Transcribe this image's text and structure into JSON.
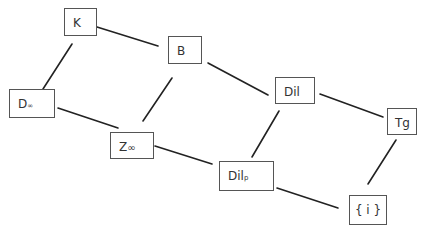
{
  "diagram": {
    "type": "lattice",
    "nodes": [
      {
        "id": "K",
        "label": "K",
        "sub": ""
      },
      {
        "id": "B",
        "label": "B",
        "sub": ""
      },
      {
        "id": "Dinf",
        "label": "D",
        "sub": "∞"
      },
      {
        "id": "Zinf",
        "label": "Z",
        "sub": "∞"
      },
      {
        "id": "Dil",
        "label": "Dil",
        "sub": ""
      },
      {
        "id": "Tg",
        "label": "Tg",
        "sub": ""
      },
      {
        "id": "Dilp",
        "label": "Dil",
        "sub": "p"
      },
      {
        "id": "I",
        "label": "{ i }",
        "sub": ""
      }
    ],
    "edges": [
      [
        "K",
        "B"
      ],
      [
        "K",
        "Dinf"
      ],
      [
        "Dinf",
        "Zinf"
      ],
      [
        "B",
        "Zinf"
      ],
      [
        "B",
        "Dil"
      ],
      [
        "Dil",
        "Tg"
      ],
      [
        "Dil",
        "Dilp"
      ],
      [
        "Zinf",
        "Dilp"
      ],
      [
        "Dilp",
        "I"
      ],
      [
        "Tg",
        "I"
      ]
    ],
    "colors": {
      "line": "#222222",
      "border": "#555555",
      "text": "#333333"
    }
  }
}
